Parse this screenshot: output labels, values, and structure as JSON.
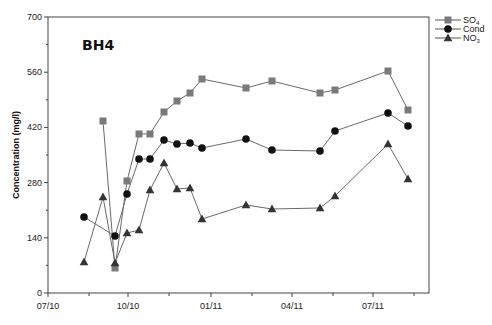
{
  "chart_data": {
    "type": "line",
    "title": "BH4",
    "xlabel": "",
    "ylabel": "Concentration (mg/l)",
    "ylim": [
      0,
      700
    ],
    "yticks": [
      0,
      140,
      280,
      420,
      560,
      700
    ],
    "xtick_labels": [
      "07/10",
      "10/10",
      "01/11",
      "04/11",
      "07/11"
    ],
    "grid": false,
    "legend_position": "top-right-outside",
    "series": [
      {
        "name": "SO4",
        "legend_label": "SO₄",
        "marker": "square",
        "color": "#7a7a7a",
        "points": [
          {
            "px": 103,
            "py": 121
          },
          {
            "px": 115,
            "py": 268
          },
          {
            "px": 127,
            "py": 181
          },
          {
            "px": 139,
            "py": 134
          },
          {
            "px": 150,
            "py": 134
          },
          {
            "px": 164,
            "py": 112
          },
          {
            "px": 177,
            "py": 101
          },
          {
            "px": 190,
            "py": 93
          },
          {
            "px": 202,
            "py": 79
          },
          {
            "px": 246,
            "py": 88
          },
          {
            "px": 272,
            "py": 81
          },
          {
            "px": 320,
            "py": 93
          },
          {
            "px": 335,
            "py": 90
          },
          {
            "px": 388,
            "py": 71
          },
          {
            "px": 408,
            "py": 110
          }
        ],
        "values": [
          365,
          135,
          285,
          405,
          405,
          460,
          485,
          505,
          540,
          515,
          535,
          505,
          515,
          565,
          465
        ]
      },
      {
        "name": "Cond",
        "legend_label": "Cond",
        "marker": "circle",
        "color": "#111111",
        "points": [
          {
            "px": 84,
            "py": 217
          },
          {
            "px": 115,
            "py": 236
          },
          {
            "px": 127,
            "py": 194
          },
          {
            "px": 139,
            "py": 159
          },
          {
            "px": 150,
            "py": 159
          },
          {
            "px": 164,
            "py": 140
          },
          {
            "px": 177,
            "py": 144
          },
          {
            "px": 190,
            "py": 143
          },
          {
            "px": 202,
            "py": 148
          },
          {
            "px": 246,
            "py": 139
          },
          {
            "px": 272,
            "py": 150
          },
          {
            "px": 320,
            "py": 151
          },
          {
            "px": 335,
            "py": 131
          },
          {
            "px": 388,
            "py": 113
          },
          {
            "px": 408,
            "py": 126
          }
        ],
        "values": [
          192,
          145,
          250,
          340,
          340,
          388,
          378,
          380,
          368,
          390,
          362,
          360,
          410,
          456,
          424
        ]
      },
      {
        "name": "NO3",
        "legend_label": "NO₃",
        "marker": "triangle",
        "color": "#333333",
        "points": [
          {
            "px": 84,
            "py": 262
          },
          {
            "px": 103,
            "py": 197
          },
          {
            "px": 115,
            "py": 263
          },
          {
            "px": 127,
            "py": 233
          },
          {
            "px": 139,
            "py": 230
          },
          {
            "px": 150,
            "py": 190
          },
          {
            "px": 164,
            "py": 163
          },
          {
            "px": 177,
            "py": 189
          },
          {
            "px": 190,
            "py": 188
          },
          {
            "px": 202,
            "py": 219
          },
          {
            "px": 246,
            "py": 205
          },
          {
            "px": 272,
            "py": 209
          },
          {
            "px": 320,
            "py": 208
          },
          {
            "px": 335,
            "py": 196
          },
          {
            "px": 388,
            "py": 144
          },
          {
            "px": 408,
            "py": 179
          }
        ],
        "values": [
          80,
          243,
          77,
          152,
          160,
          262,
          330,
          264,
          267,
          188,
          223,
          213,
          216,
          246,
          378,
          290
        ]
      }
    ]
  },
  "chart": {
    "title": "BH4",
    "ylabel": "Concentration (mg/l)",
    "legend": [
      {
        "label": "SO",
        "sub": "4"
      },
      {
        "label": "Cond",
        "sub": ""
      },
      {
        "label": "NO",
        "sub": "3"
      }
    ]
  }
}
